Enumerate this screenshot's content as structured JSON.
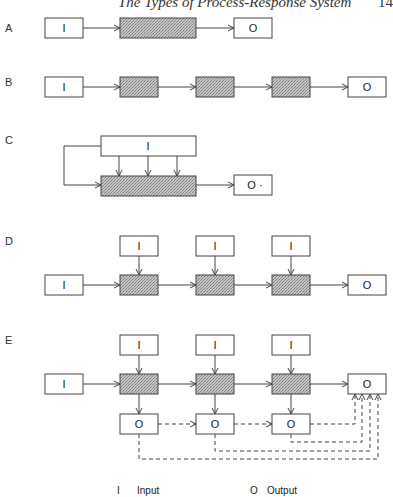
{
  "header": {
    "title": "The Types of Process-Response System",
    "page_number": "14"
  },
  "panels": {
    "A": {
      "label": "A",
      "input": "I",
      "output": "O"
    },
    "B": {
      "label": "B",
      "input": "I",
      "output": "O"
    },
    "C": {
      "label": "C",
      "input": "I",
      "output": "O ·"
    },
    "D": {
      "label": "D",
      "inputs": [
        "I",
        "I",
        "I",
        "I"
      ],
      "output": "O"
    },
    "E": {
      "label": "E",
      "inputs": [
        "I",
        "I",
        "I",
        "I"
      ],
      "outputs": [
        "O",
        "O",
        "O",
        "O"
      ]
    }
  },
  "legend": {
    "input_symbol": "I",
    "input_label": "Input",
    "output_symbol": "O",
    "output_label": "Output"
  },
  "colors": {
    "line": "#444444",
    "process_fill": "#b8b8b8"
  }
}
